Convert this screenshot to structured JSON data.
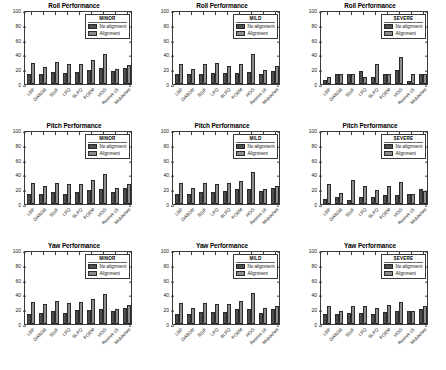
{
  "figure": {
    "width": 446,
    "height": 370,
    "background": "#ffffff",
    "rows": 3,
    "cols": 3
  },
  "series_colors": {
    "no_alignment": "#4d4d4d",
    "alignment": "#8c8c8c"
  },
  "axis": {
    "yticks": [
      0,
      20,
      40,
      60,
      80,
      100
    ],
    "ylim": [
      0,
      100
    ],
    "categories": [
      "LBP",
      "GABOR",
      "BSIF",
      "LPQ",
      "BLPQ",
      "POEM",
      "HOG",
      "Resnet-18",
      "MobileNet"
    ]
  },
  "legend": {
    "series_labels": [
      "No alignment",
      "Alignment"
    ],
    "titles": [
      "MINOR",
      "MILD",
      "SEVERE"
    ]
  },
  "chart_data": [
    {
      "type": "bar",
      "panel": "roll-minor",
      "title": "Roll Performance",
      "legend_title": "MINOR",
      "xlabel": "",
      "ylabel": "",
      "ylim": [
        0,
        100
      ],
      "yticks": [
        0,
        20,
        40,
        60,
        80,
        100
      ],
      "grid": false,
      "legend_position": "top-right",
      "categories": [
        "LBP",
        "GABOR",
        "BSIF",
        "LPQ",
        "BLPQ",
        "POEM",
        "HOG",
        "Resnet-18",
        "MobileNet"
      ],
      "series": [
        {
          "name": "No alignment",
          "values": [
            13,
            14,
            16,
            15,
            16,
            19,
            21,
            17,
            21
          ]
        },
        {
          "name": "Alignment",
          "values": [
            29,
            23,
            30,
            27,
            27,
            33,
            41,
            20,
            26
          ]
        }
      ]
    },
    {
      "type": "bar",
      "panel": "roll-mild",
      "title": "Roll Performance",
      "legend_title": "MILD",
      "xlabel": "",
      "ylabel": "",
      "ylim": [
        0,
        100
      ],
      "yticks": [
        0,
        20,
        40,
        60,
        80,
        100
      ],
      "grid": false,
      "legend_position": "top-right",
      "categories": [
        "LBP",
        "GABOR",
        "BSIF",
        "LPQ",
        "BLPQ",
        "POEM",
        "HOG",
        "Resnet-18",
        "MobileNet"
      ],
      "series": [
        {
          "name": "No alignment",
          "values": [
            14,
            13,
            13,
            15,
            15,
            15,
            16,
            13,
            18
          ]
        },
        {
          "name": "Alignment",
          "values": [
            27,
            20,
            27,
            28,
            25,
            27,
            40,
            19,
            24
          ]
        }
      ]
    },
    {
      "type": "bar",
      "panel": "roll-severe",
      "title": "Roll Performance",
      "legend_title": "SEVERE",
      "xlabel": "",
      "ylabel": "",
      "ylim": [
        0,
        100
      ],
      "yticks": [
        0,
        20,
        40,
        60,
        80,
        100
      ],
      "grid": false,
      "legend_position": "top-right",
      "categories": [
        "LBP",
        "GABOR",
        "BSIF",
        "LPQ",
        "BLPQ",
        "POEM",
        "HOG",
        "Resnet-18",
        "MobileNet"
      ],
      "series": [
        {
          "name": "No alignment",
          "values": [
            6,
            13,
            13,
            18,
            9,
            13,
            19,
            4,
            13
          ]
        },
        {
          "name": "Alignment",
          "values": [
            9,
            14,
            14,
            9,
            27,
            13,
            37,
            14,
            14
          ]
        }
      ]
    },
    {
      "type": "bar",
      "panel": "pitch-minor",
      "title": "Pitch Performance",
      "legend_title": "MINOR",
      "xlabel": "",
      "ylabel": "",
      "ylim": [
        0,
        100
      ],
      "yticks": [
        0,
        20,
        40,
        60,
        80,
        100
      ],
      "grid": false,
      "legend_position": "top-right",
      "categories": [
        "LBP",
        "GABOR",
        "BSIF",
        "LPQ",
        "BLPQ",
        "POEM",
        "HOG",
        "Resnet-18",
        "MobileNet"
      ],
      "series": [
        {
          "name": "No alignment",
          "values": [
            13,
            14,
            16,
            14,
            16,
            19,
            20,
            16,
            21
          ]
        },
        {
          "name": "Alignment",
          "values": [
            28,
            24,
            28,
            27,
            27,
            33,
            41,
            21,
            27
          ]
        }
      ]
    },
    {
      "type": "bar",
      "panel": "pitch-mild",
      "title": "Pitch Performance",
      "legend_title": "MILD",
      "xlabel": "",
      "ylabel": "",
      "ylim": [
        0,
        100
      ],
      "yticks": [
        0,
        20,
        40,
        60,
        80,
        100
      ],
      "grid": false,
      "legend_position": "top-right",
      "categories": [
        "LBP",
        "GABOR",
        "BSIF",
        "LPQ",
        "BLPQ",
        "POEM",
        "HOG",
        "Resnet-18",
        "MobileNet"
      ],
      "series": [
        {
          "name": "No alignment",
          "values": [
            13,
            14,
            16,
            16,
            17,
            20,
            20,
            17,
            21
          ]
        },
        {
          "name": "Alignment",
          "values": [
            28,
            21,
            28,
            27,
            28,
            31,
            43,
            20,
            24
          ]
        }
      ]
    },
    {
      "type": "bar",
      "panel": "pitch-severe",
      "title": "Pitch Performance",
      "legend_title": "SEVERE",
      "xlabel": "",
      "ylabel": "",
      "ylim": [
        0,
        100
      ],
      "yticks": [
        0,
        20,
        40,
        60,
        80,
        100
      ],
      "grid": false,
      "legend_position": "top-right",
      "categories": [
        "LBP",
        "GABOR",
        "BSIF",
        "LPQ",
        "BLPQ",
        "POEM",
        "HOG",
        "Resnet-18",
        "MobileNet"
      ],
      "series": [
        {
          "name": "No alignment",
          "values": [
            7,
            9,
            5,
            9,
            10,
            12,
            12,
            14,
            20
          ]
        },
        {
          "name": "Alignment",
          "values": [
            27,
            15,
            33,
            24,
            19,
            24,
            30,
            13,
            18
          ]
        }
      ]
    },
    {
      "type": "bar",
      "panel": "yaw-minor",
      "title": "Yaw Performance",
      "legend_title": "MINOR",
      "xlabel": "",
      "ylabel": "",
      "ylim": [
        0,
        100
      ],
      "yticks": [
        0,
        20,
        40,
        60,
        80,
        100
      ],
      "grid": false,
      "legend_position": "top-right",
      "categories": [
        "LBP",
        "GABOR",
        "BSIF",
        "LPQ",
        "BLPQ",
        "POEM",
        "HOG",
        "Resnet-18",
        "MobileNet"
      ],
      "series": [
        {
          "name": "No alignment",
          "values": [
            14,
            15,
            17,
            15,
            19,
            19,
            20,
            18,
            21
          ]
        },
        {
          "name": "Alignment",
          "values": [
            30,
            27,
            31,
            29,
            30,
            34,
            41,
            20,
            26
          ]
        }
      ]
    },
    {
      "type": "bar",
      "panel": "yaw-mild",
      "title": "Yaw Performance",
      "legend_title": "MILD",
      "xlabel": "",
      "ylabel": "",
      "ylim": [
        0,
        100
      ],
      "yticks": [
        0,
        20,
        40,
        60,
        80,
        100
      ],
      "grid": false,
      "legend_position": "top-right",
      "categories": [
        "LBP",
        "GABOR",
        "BSIF",
        "LPQ",
        "BLPQ",
        "POEM",
        "HOG",
        "Resnet-18",
        "MobileNet"
      ],
      "series": [
        {
          "name": "No alignment",
          "values": [
            13,
            14,
            16,
            16,
            16,
            20,
            20,
            15,
            20
          ]
        },
        {
          "name": "Alignment",
          "values": [
            28,
            21,
            28,
            27,
            27,
            31,
            42,
            22,
            25
          ]
        }
      ]
    },
    {
      "type": "bar",
      "panel": "yaw-severe",
      "title": "Yaw Performance",
      "legend_title": "SEVERE",
      "xlabel": "",
      "ylabel": "",
      "ylim": [
        0,
        100
      ],
      "yticks": [
        0,
        20,
        40,
        60,
        80,
        100
      ],
      "grid": false,
      "legend_position": "top-right",
      "categories": [
        "LBP",
        "GABOR",
        "BSIF",
        "LPQ",
        "BLPQ",
        "POEM",
        "HOG",
        "Resnet-18",
        "MobileNet"
      ],
      "series": [
        {
          "name": "No alignment",
          "values": [
            13,
            13,
            15,
            15,
            14,
            16,
            18,
            17,
            20
          ]
        },
        {
          "name": "Alignment",
          "values": [
            25,
            18,
            24,
            24,
            22,
            26,
            30,
            17,
            25
          ]
        }
      ]
    }
  ]
}
